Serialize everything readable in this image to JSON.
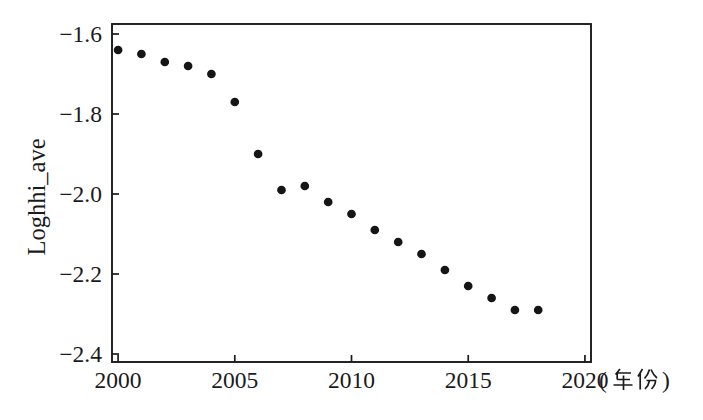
{
  "page": {
    "background": "#ffffff",
    "description_colors": {
      "ink": "#1b1b1b",
      "frame": "#1b1b1b"
    }
  },
  "chart_data": {
    "type": "scatter",
    "title": "",
    "ylabel": "Loghhi_ave",
    "x_unit": "(年份)",
    "x_unit_open": "(",
    "x_unit_cjk": "年份",
    "x_unit_close": ")",
    "x": [
      2000,
      2001,
      2002,
      2003,
      2004,
      2005,
      2006,
      2007,
      2008,
      2009,
      2010,
      2011,
      2012,
      2013,
      2014,
      2015,
      2016,
      2017,
      2018
    ],
    "y": [
      -1.64,
      -1.65,
      -1.67,
      -1.68,
      -1.7,
      -1.77,
      -1.9,
      -1.99,
      -1.98,
      -2.02,
      -2.05,
      -2.09,
      -2.12,
      -2.15,
      -2.19,
      -2.23,
      -2.26,
      -2.29,
      -2.29
    ],
    "x_ticks": [
      2000,
      2005,
      2010,
      2015,
      2020
    ],
    "x_tick_labels": [
      "2000",
      "2005",
      "2010",
      "2015",
      "2020"
    ],
    "y_ticks": [
      -1.6,
      -1.8,
      -2.0,
      -2.2,
      -2.4
    ],
    "y_tick_labels": [
      "−1.6",
      "−1.8",
      "−2.0",
      "−2.2",
      "−2.4"
    ],
    "xlim": [
      1999.74,
      2020.26
    ],
    "ylim": [
      -2.42,
      -1.575
    ],
    "grid": false,
    "legend_shown": false,
    "marker": {
      "shape": "filled-circle",
      "fill": "#151515",
      "radius_px": 4.35
    },
    "frame_color": "#1b1b1b",
    "ticks_direction": "in"
  }
}
